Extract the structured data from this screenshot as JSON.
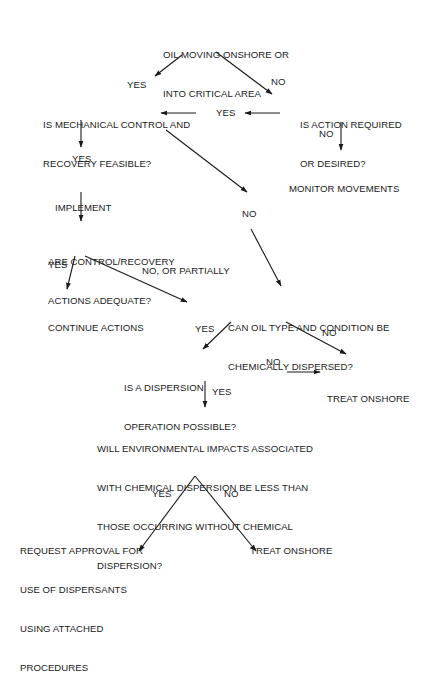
{
  "diagram": {
    "type": "flowchart",
    "nodes": {
      "start": {
        "lines": [
          "OIL MOVING ONSHORE OR",
          "INTO CRITICAL AREA"
        ]
      },
      "mechanical": {
        "lines": [
          "IS MECHANICAL CONTROL AND",
          "RECOVERY FEASIBLE?"
        ]
      },
      "action_required": {
        "lines": [
          "IS ACTION REQUIRED",
          "OR DESIRED?"
        ]
      },
      "monitor": {
        "lines": [
          "MONITOR MOVEMENTS"
        ]
      },
      "implement": {
        "lines": [
          "IMPLEMENT"
        ]
      },
      "adequate": {
        "lines": [
          "ARE CONTROL/RECOVERY",
          "ACTIONS ADEQUATE?"
        ]
      },
      "continue": {
        "lines": [
          "CONTINUE ACTIONS"
        ]
      },
      "chem_dispersed": {
        "lines": [
          "CAN OIL TYPE AND CONDITION BE",
          "CHEMICALLY DISPERSED?"
        ]
      },
      "dispersion_possible": {
        "lines": [
          "IS A DISPERSION",
          "OPERATION POSSIBLE?"
        ]
      },
      "treat_onshore_1": {
        "lines": [
          "TREAT ONSHORE"
        ]
      },
      "impacts": {
        "lines": [
          "WILL ENVIRONMENTAL IMPACTS ASSOCIATED",
          "WITH CHEMICAL DISPERSION BE LESS THAN",
          "THOSE OCCURRING WITHOUT CHEMICAL",
          "DISPERSION?"
        ]
      },
      "request_approval": {
        "lines": [
          "REQUEST APPROVAL FOR",
          "USE OF DISPERSANTS",
          "USING ATTACHED",
          "PROCEDURES"
        ]
      },
      "treat_onshore_2": {
        "lines": [
          "TREAT ONSHORE"
        ]
      }
    },
    "edges": [
      {
        "from": "start",
        "to": "mechanical",
        "label": "YES"
      },
      {
        "from": "start",
        "to": "action_required",
        "label": "NO"
      },
      {
        "from": "action_required",
        "to": "mechanical",
        "label": "YES"
      },
      {
        "from": "action_required",
        "to": "monitor",
        "label": "NO"
      },
      {
        "from": "mechanical",
        "to": "implement",
        "label": "YES"
      },
      {
        "from": "mechanical",
        "to": "chem_dispersed",
        "label": "NO"
      },
      {
        "from": "implement",
        "to": "adequate",
        "label": ""
      },
      {
        "from": "adequate",
        "to": "continue",
        "label": "YES"
      },
      {
        "from": "adequate",
        "to": "chem_dispersed",
        "label": "NO, OR PARTIALLY"
      },
      {
        "from": "chem_dispersed",
        "to": "dispersion_possible",
        "label": "YES"
      },
      {
        "from": "chem_dispersed",
        "to": "treat_onshore_1",
        "label": "NO"
      },
      {
        "from": "dispersion_possible",
        "to": "treat_onshore_1",
        "label": "NO"
      },
      {
        "from": "dispersion_possible",
        "to": "impacts",
        "label": "YES"
      },
      {
        "from": "impacts",
        "to": "request_approval",
        "label": "YES"
      },
      {
        "from": "impacts",
        "to": "treat_onshore_2",
        "label": "NO"
      }
    ]
  },
  "labels": {
    "yes_1": "YES",
    "no_1": "NO",
    "yes_2": "YES",
    "no_2": "NO",
    "yes_3": "YES",
    "no_3": "NO",
    "yes_4": "YES",
    "no_partially": "NO, OR PARTIALLY",
    "yes_5": "YES",
    "no_4": "NO",
    "no_5": "NO",
    "yes_6": "YES",
    "yes_7": "YES",
    "no_6": "NO"
  }
}
